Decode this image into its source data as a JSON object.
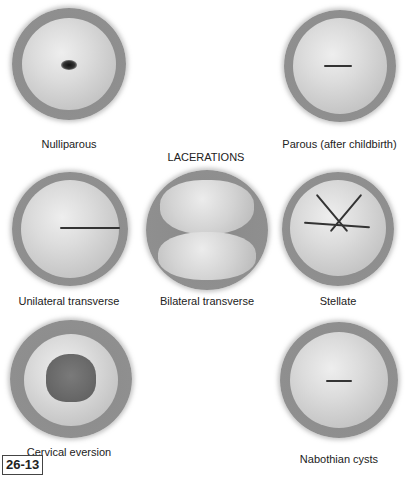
{
  "figure": {
    "number": "26-13",
    "section_heading": "LACERATIONS",
    "panels": [
      {
        "id": "nulliparous",
        "label": "Nulliparous",
        "os_shape": "small round dot"
      },
      {
        "id": "parous",
        "label": "Parous (after childbirth)",
        "os_shape": "horizontal slit"
      },
      {
        "id": "unilateral",
        "label": "Unilateral transverse",
        "os_shape": "one-sided transverse tear"
      },
      {
        "id": "bilateral",
        "label": "Bilateral transverse",
        "os_shape": "two-sided transverse tear"
      },
      {
        "id": "stellate",
        "label": "Stellate",
        "os_shape": "star-shaped tear"
      },
      {
        "id": "eversion",
        "label": "Cervical eversion",
        "os_shape": "everted red columnar epithelium"
      },
      {
        "id": "nabothian",
        "label": "Nabothian cysts",
        "os_shape": "slit with surrounding cysts"
      }
    ]
  }
}
